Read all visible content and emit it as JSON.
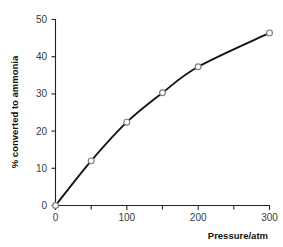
{
  "chart_data": {
    "type": "line",
    "title": "",
    "xlabel": "Pressure/atm",
    "ylabel": "% converted to ammonia",
    "xlim": [
      0,
      300
    ],
    "ylim": [
      0,
      50
    ],
    "grid": false,
    "legend": false,
    "x_ticks_major": [
      0,
      100,
      200,
      300
    ],
    "x_ticks_major_labels": [
      "0",
      "100",
      "200",
      "300"
    ],
    "x_ticks_minor": [
      50,
      150,
      250
    ],
    "y_ticks_major": [
      0,
      10,
      20,
      30,
      40,
      50
    ],
    "y_ticks_major_labels": [
      "0",
      "10",
      "20",
      "30",
      "40",
      "50"
    ],
    "x": [
      0,
      50,
      100,
      150,
      200,
      300
    ],
    "values": [
      0,
      12.0,
      22.4,
      30.3,
      37.3,
      46.4
    ],
    "series": [
      {
        "name": "% converted to ammonia",
        "x": [
          0,
          50,
          100,
          150,
          200,
          300
        ],
        "values": [
          0,
          12.0,
          22.4,
          30.3,
          37.3,
          46.4
        ]
      }
    ],
    "marker": "open-circle",
    "line_color": "#141414",
    "marker_edge_color": "#7d7d7d",
    "marker_face_color": "#ffffff",
    "background_color": "#ffffff"
  },
  "axes": {
    "x_title": "Pressure/atm",
    "y_title": "% converted to ammonia",
    "x_tick_labels": [
      "0",
      "100",
      "200",
      "300"
    ],
    "y_tick_labels": [
      "0",
      "10",
      "20",
      "30",
      "40",
      "50"
    ]
  }
}
